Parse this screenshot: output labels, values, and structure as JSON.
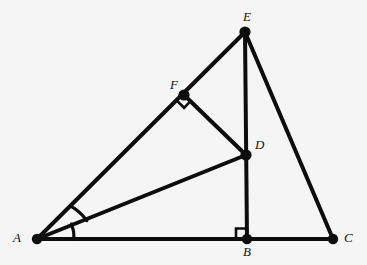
{
  "figure": {
    "kind": "geometry-diagram",
    "width": 367,
    "height": 265,
    "background_color": "#f5f5f5",
    "ink_color": "#0d0d0d",
    "stroke_width": 4,
    "vertex_dot_radius": 5
  },
  "points": {
    "A": {
      "label": "A",
      "x": 37,
      "y": 239,
      "label_x": 13,
      "label_y": 231
    },
    "B": {
      "label": "B",
      "x": 247,
      "y": 239,
      "label_x": 243,
      "label_y": 245
    },
    "C": {
      "label": "C",
      "x": 333,
      "y": 239,
      "label_x": 344,
      "label_y": 231
    },
    "D": {
      "label": "D",
      "x": 246,
      "y": 155,
      "label_x": 255,
      "label_y": 138
    },
    "E": {
      "label": "E",
      "x": 245,
      "y": 32,
      "label_x": 243,
      "label_y": 10
    },
    "F": {
      "label": "F",
      "x": 184,
      "y": 95,
      "label_x": 170,
      "label_y": 78
    }
  },
  "segments": [
    {
      "name": "segment-AC",
      "from": "A",
      "to": "C"
    },
    {
      "name": "segment-AE",
      "from": "A",
      "to": "E"
    },
    {
      "name": "segment-EB",
      "from": "E",
      "to": "B"
    },
    {
      "name": "segment-EC",
      "from": "E",
      "to": "C"
    },
    {
      "name": "segment-AD",
      "from": "A",
      "to": "D"
    },
    {
      "name": "segment-FD",
      "from": "F",
      "to": "D"
    }
  ],
  "right_angle_marks": [
    {
      "name": "right-angle-at-F",
      "vertex": "F",
      "size": 9,
      "note": "between FA and FD"
    },
    {
      "name": "right-angle-at-B",
      "vertex": "B",
      "size": 10,
      "note": "between BA and BE"
    }
  ],
  "angle_arcs": [
    {
      "name": "angle-arc-EAD",
      "vertex": "A",
      "radius": 50,
      "note": "between ray AE and ray AD"
    },
    {
      "name": "angle-arc-DAC",
      "vertex": "A",
      "radius": 37,
      "note": "between ray AD and ray AC"
    }
  ],
  "labels_order": [
    "E",
    "F",
    "D",
    "A",
    "B",
    "C"
  ]
}
